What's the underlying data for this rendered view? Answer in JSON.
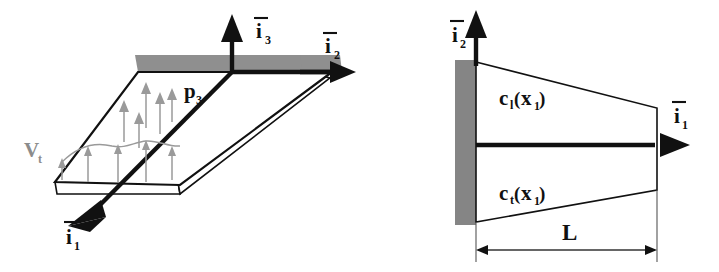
{
  "figure": {
    "background_color": "#ffffff",
    "ink_color": "#111111",
    "grey_color": "#8f8f8f",
    "light_grey_color": "#9a9a9a"
  },
  "left_panel": {
    "name": "3D wing with pressure loading",
    "labels": {
      "axis_i3": {
        "base": "i",
        "sub": "3",
        "overbar": true
      },
      "axis_i2": {
        "base": "i",
        "sub": "2",
        "overbar": true
      },
      "axis_i1": {
        "base": "i",
        "sub": "1",
        "overbar": true
      },
      "pressure": {
        "base": "p",
        "sub": "3",
        "overbar": false
      },
      "velocity": {
        "base": "V",
        "sub": "t",
        "overbar": false
      }
    }
  },
  "right_panel": {
    "name": "Planform chord distribution",
    "labels": {
      "axis_i2": {
        "base": "i",
        "sub": "2",
        "overbar": true
      },
      "axis_i1": {
        "base": "i",
        "sub": "1",
        "overbar": true
      },
      "chord_leading": {
        "base": "c",
        "sub": "l",
        "arg_base": "x",
        "arg_sub": "1"
      },
      "chord_trailing": {
        "base": "c",
        "sub": "t",
        "arg_base": "x",
        "arg_sub": "1"
      },
      "span_dimension": "L"
    }
  }
}
